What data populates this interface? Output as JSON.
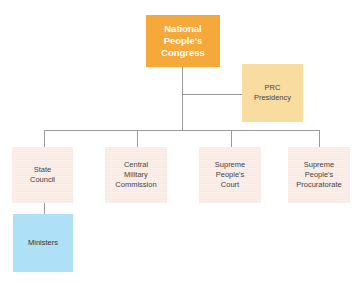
{
  "title_node": {
    "label_lines": [
      "National",
      "People's",
      "Congress"
    ],
    "color": "#f5a93a"
  },
  "presidency": {
    "label_lines": [
      "PRC",
      "Presidency"
    ],
    "color": "#f9dca0"
  },
  "branches": [
    {
      "label_lines": [
        "State",
        "Council"
      ]
    },
    {
      "label_lines": [
        "Central",
        "Military",
        "Commission"
      ]
    },
    {
      "label_lines": [
        "Supreme",
        "People's",
        "Court"
      ]
    },
    {
      "label_lines": [
        "Supreme",
        "People's",
        "Procuratorate"
      ]
    }
  ],
  "ministers": {
    "label": "Ministers",
    "color": "#aee0f7"
  },
  "colors": {
    "branch_fill": "#fbe9e2",
    "connector": "#9a9a9a"
  }
}
